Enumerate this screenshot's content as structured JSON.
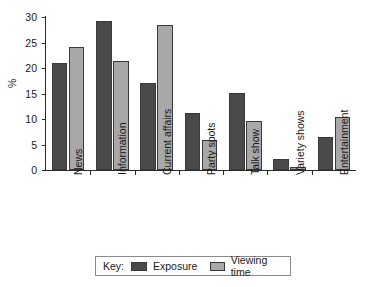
{
  "chart_data": {
    "type": "bar",
    "title": "",
    "xlabel": "",
    "ylabel": "%",
    "ylim": [
      0,
      30
    ],
    "yticks": [
      0,
      5,
      10,
      15,
      20,
      25,
      30
    ],
    "grid": false,
    "legend_position": "bottom",
    "legend_title": "Key:",
    "categories": [
      "News",
      "Information",
      "Current affairs",
      "Party spots",
      "Talk show",
      "Variety shows",
      "Entertainment"
    ],
    "series": [
      {
        "name": "Exposure",
        "color": "#4a4a4a",
        "values": [
          21.0,
          29.2,
          17.1,
          11.1,
          15.1,
          2.1,
          6.5
        ]
      },
      {
        "name": "Viewing time",
        "color": "#a8a8a8",
        "values": [
          24.2,
          21.3,
          28.5,
          5.9,
          9.7,
          0.6,
          10.4
        ]
      }
    ]
  }
}
